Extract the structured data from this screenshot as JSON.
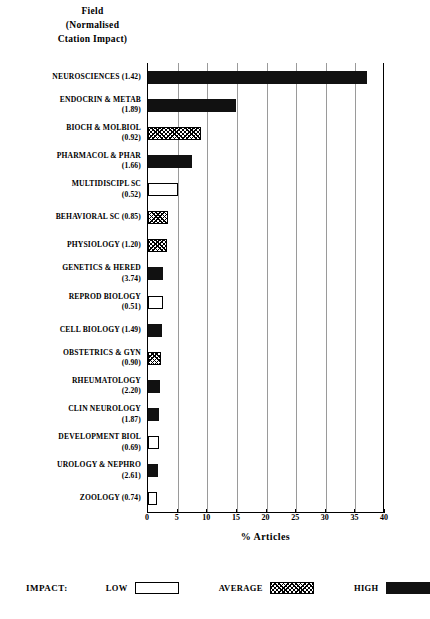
{
  "header": {
    "lines": [
      "Field",
      "(Normalised",
      "Ctation Impact)"
    ]
  },
  "axis": {
    "x_title": "% Articles",
    "x_ticks": [
      "0",
      "5",
      "10",
      "15",
      "20",
      "25",
      "30",
      "35",
      "40"
    ]
  },
  "legend": {
    "title": "IMPACT:",
    "items": [
      {
        "label": "LOW",
        "style": "low"
      },
      {
        "label": "AVERAGE",
        "style": "average"
      },
      {
        "label": "HIGH",
        "style": "high"
      }
    ]
  },
  "colors": {
    "high": "#111111",
    "average": "#ffffff",
    "low": "#ffffff",
    "axis": "#000000",
    "grid": "#9a9a9a"
  },
  "chart_data": {
    "type": "bar",
    "orientation": "horizontal",
    "title": "Field (Normalised Ctation Impact)",
    "xlabel": "% Articles",
    "ylabel": "Field (Normalised Ctation Impact)",
    "xlim": [
      0,
      40
    ],
    "xticks": [
      0,
      5,
      10,
      15,
      20,
      25,
      30,
      35,
      40
    ],
    "grid": true,
    "legend_position": "bottom",
    "legend_title": "IMPACT:",
    "legend_entries": [
      "LOW",
      "AVERAGE",
      "HIGH"
    ],
    "categories": [
      "NEUROSCIENCES",
      "ENDOCRIN & METAB",
      "BIOCH & MOLBIOL",
      "PHARMACOL & PHAR",
      "MULTIDISCIPL SC",
      "BEHAVIORAL SC",
      "PHYSIOLOGY",
      "GENETICS & HERED",
      "REPROD BIOLOGY",
      "CELL BIOLOGY",
      "OBSTETRICS & GYN",
      "RHEUMATOLOGY",
      "CLIN NEUROLOGY",
      "DEVELOPMENT BIOL",
      "UROLOGY & NEPHRO",
      "ZOOLOGY"
    ],
    "citation_impact": [
      1.42,
      1.89,
      0.92,
      1.66,
      0.52,
      0.85,
      1.2,
      3.74,
      0.51,
      1.49,
      0.9,
      2.2,
      1.87,
      0.69,
      2.61,
      0.74
    ],
    "values": [
      37.0,
      14.9,
      8.9,
      7.4,
      5.1,
      3.4,
      3.2,
      2.6,
      2.5,
      2.3,
      2.2,
      2.1,
      1.9,
      1.8,
      1.7,
      1.5
    ],
    "impact_class": [
      "high",
      "high",
      "average",
      "high",
      "low",
      "average",
      "average",
      "high",
      "low",
      "high",
      "average",
      "high",
      "high",
      "low",
      "high",
      "low"
    ]
  },
  "rows": [
    {
      "line1": "NEUROSCIENCES  (1.42)",
      "line2": ""
    },
    {
      "line1": "ENDOCRIN & METAB",
      "line2": "(1.89)"
    },
    {
      "line1": "BIOCH & MOLBIOL",
      "line2": "(0.92)"
    },
    {
      "line1": "PHARMACOL & PHAR",
      "line2": "(1.66)"
    },
    {
      "line1": "MULTIDISCIPL SC",
      "line2": "(0.52)"
    },
    {
      "line1": "BEHAVIORAL SC   (0.85)",
      "line2": ""
    },
    {
      "line1": "PHYSIOLOGY   (1.20)",
      "line2": ""
    },
    {
      "line1": "GENETICS & HERED",
      "line2": "(3.74)"
    },
    {
      "line1": "REPROD BIOLOGY",
      "line2": "(0.51)"
    },
    {
      "line1": "CELL BIOLOGY  (1.49)",
      "line2": ""
    },
    {
      "line1": "OBSTETRICS & GYN",
      "line2": "(0.90)"
    },
    {
      "line1": "RHEUMATOLOGY",
      "line2": "(2.20)"
    },
    {
      "line1": "CLIN NEUROLOGY",
      "line2": "(1.87)"
    },
    {
      "line1": "DEVELOPMENT BIOL",
      "line2": "(0.69)"
    },
    {
      "line1": "UROLOGY & NEPHRO",
      "line2": "(2.61)"
    },
    {
      "line1": "ZOOLOGY   (0.74)",
      "line2": ""
    }
  ]
}
